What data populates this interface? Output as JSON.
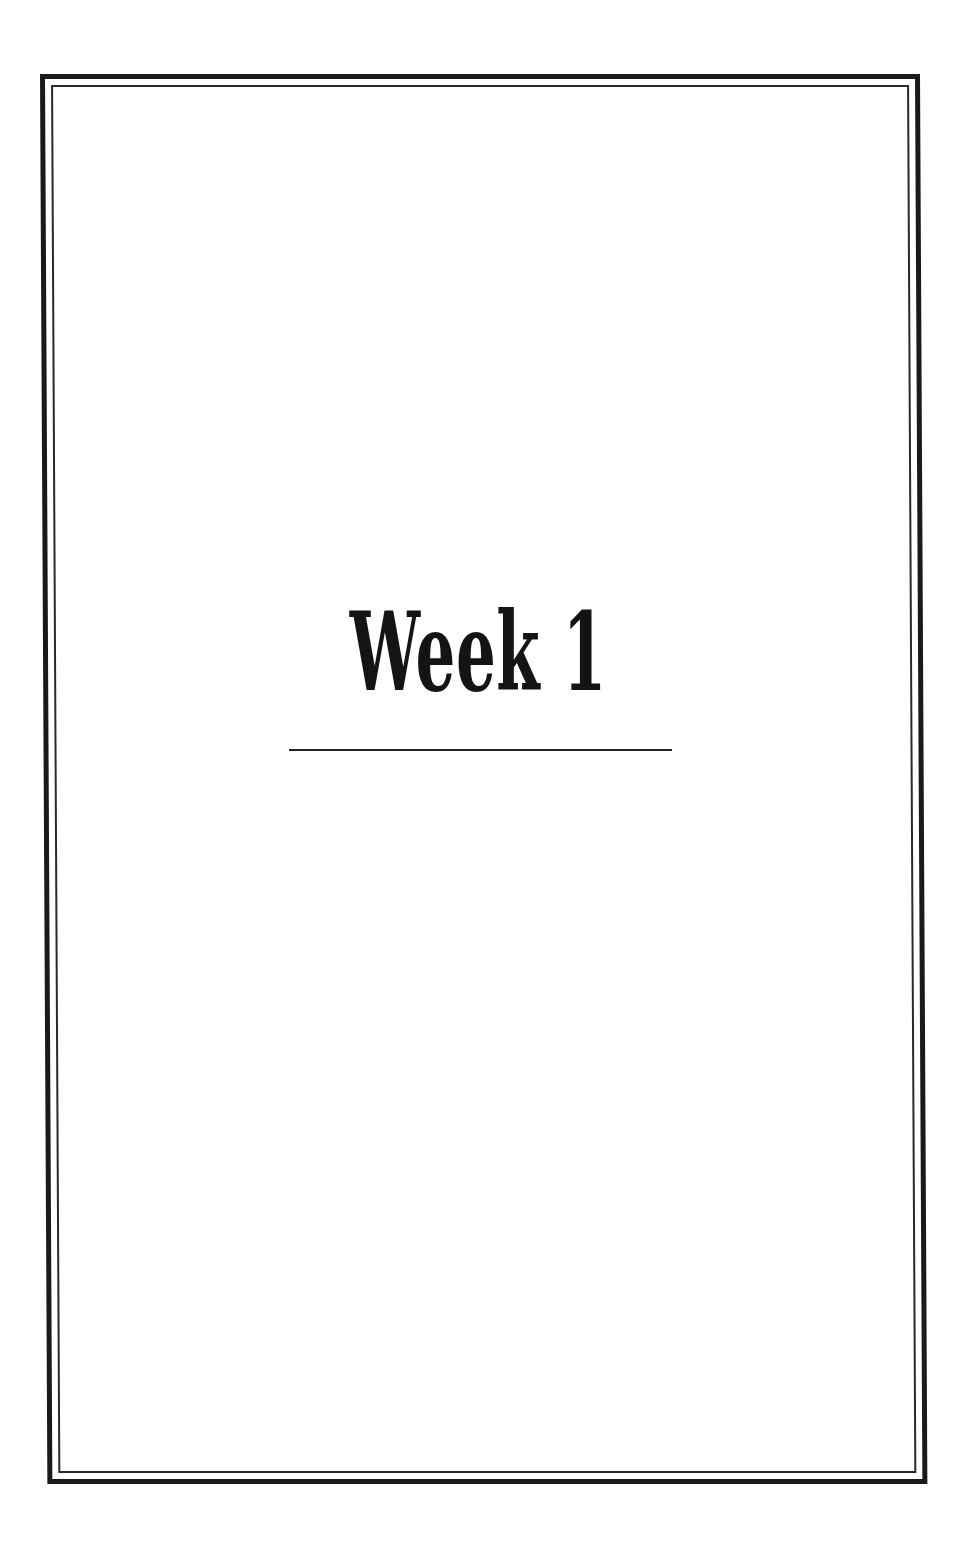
{
  "page": {
    "title": "Week 1",
    "colors": {
      "ink": "#141414",
      "background": "#ffffff"
    }
  }
}
